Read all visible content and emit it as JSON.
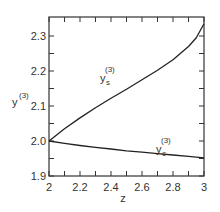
{
  "chart_data": {
    "type": "line",
    "title": "",
    "xlabel": "z",
    "ylabel": "y(3)",
    "ylabel_base": "y",
    "ylabel_sup": "(3)",
    "xlim": [
      2,
      3
    ],
    "ylim": [
      1.9,
      2.335
    ],
    "grid": false,
    "legend": "inline curve labels",
    "x_ticks": [
      "2",
      "2.2",
      "2.4",
      "2.6",
      "2.8",
      "3"
    ],
    "y_ticks": [
      "1.9",
      "2.0",
      "2.1",
      "2.2",
      "2.3"
    ],
    "series": [
      {
        "name": "y_s(3)",
        "label_base": "y",
        "label_sub": "s",
        "label_sup": "(3)",
        "x": [
          2.0,
          2.1,
          2.2,
          2.3,
          2.4,
          2.5,
          2.6,
          2.7,
          2.8,
          2.9,
          2.95,
          3.0
        ],
        "values": [
          2.0,
          2.035,
          2.066,
          2.095,
          2.122,
          2.148,
          2.175,
          2.202,
          2.232,
          2.27,
          2.295,
          2.335
        ]
      },
      {
        "name": "y_c(3)",
        "label_base": "y",
        "label_sub": "c",
        "label_sup": "(3)",
        "x": [
          2.0,
          2.1,
          2.2,
          2.3,
          2.4,
          2.5,
          2.6,
          2.7,
          2.8,
          2.9,
          3.0
        ],
        "values": [
          2.0,
          1.993,
          1.987,
          1.982,
          1.977,
          1.972,
          1.968,
          1.964,
          1.96,
          1.956,
          1.952
        ]
      }
    ]
  }
}
